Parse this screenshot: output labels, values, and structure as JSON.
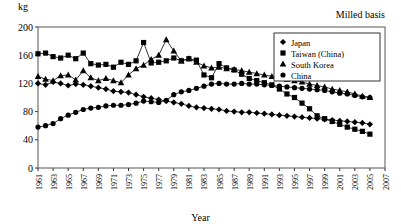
{
  "figure": {
    "unit_label": "kg",
    "note": "Milled basis",
    "xlabel": "Year"
  },
  "legend": {
    "position": "top-right",
    "items": [
      {
        "label": "Japan",
        "marker": "diamond-marker"
      },
      {
        "label": "Taiwan (China)",
        "marker": "square-marker"
      },
      {
        "label": "South Korea",
        "marker": "triangle-marker"
      },
      {
        "label": "China",
        "marker": "circle-marker"
      }
    ]
  },
  "chart_data": {
    "type": "line",
    "title": "",
    "subtitle": "",
    "annotation": "Milled basis",
    "xlabel": "Year",
    "ylabel": "kg",
    "ylim": [
      0,
      200
    ],
    "yticks": [
      0,
      40,
      80,
      120,
      160,
      200
    ],
    "xlim": [
      1961,
      2007
    ],
    "xticks": [
      1961,
      1963,
      1965,
      1967,
      1969,
      1971,
      1973,
      1975,
      1977,
      1979,
      1981,
      1983,
      1985,
      1987,
      1989,
      1991,
      1993,
      1995,
      1997,
      1999,
      2001,
      2003,
      2005,
      2007
    ],
    "grid": false,
    "legend_position": "upper right",
    "x": [
      1961,
      1962,
      1963,
      1964,
      1965,
      1966,
      1967,
      1968,
      1969,
      1970,
      1971,
      1972,
      1973,
      1974,
      1975,
      1976,
      1977,
      1978,
      1979,
      1980,
      1981,
      1982,
      1983,
      1984,
      1985,
      1986,
      1987,
      1988,
      1989,
      1990,
      1991,
      1992,
      1993,
      1994,
      1995,
      1996,
      1997,
      1998,
      1999,
      2000,
      2001,
      2002,
      2003,
      2004,
      2005
    ],
    "series": [
      {
        "name": "Japan",
        "marker": "diamond",
        "values": [
          120,
          118,
          122,
          120,
          117,
          119,
          118,
          116,
          114,
          112,
          109,
          108,
          107,
          104,
          101,
          99,
          97,
          95,
          93,
          91,
          88,
          86,
          85,
          84,
          83,
          81,
          80,
          79,
          79,
          78,
          77,
          76,
          75,
          74,
          73,
          72,
          71,
          70,
          69,
          68,
          67,
          66,
          65,
          64,
          62
        ]
      },
      {
        "name": "Taiwan (China)",
        "marker": "square",
        "values": [
          162,
          163,
          158,
          156,
          160,
          155,
          163,
          148,
          146,
          147,
          143,
          150,
          147,
          152,
          178,
          149,
          150,
          152,
          156,
          152,
          155,
          153,
          132,
          128,
          148,
          142,
          139,
          133,
          127,
          124,
          121,
          118,
          112,
          105,
          100,
          92,
          84,
          74,
          70,
          66,
          62,
          58,
          55,
          52,
          48
        ]
      },
      {
        "name": "South Korea",
        "marker": "triangle",
        "values": [
          130,
          126,
          124,
          131,
          132,
          125,
          138,
          128,
          124,
          127,
          124,
          121,
          132,
          141,
          146,
          154,
          160,
          182,
          166,
          152,
          155,
          150,
          145,
          142,
          143,
          141,
          140,
          138,
          136,
          134,
          132,
          130,
          128,
          126,
          124,
          122,
          119,
          117,
          115,
          112,
          110,
          108,
          105,
          102,
          100
        ]
      },
      {
        "name": "China",
        "marker": "circle",
        "values": [
          58,
          60,
          63,
          70,
          75,
          79,
          83,
          85,
          86,
          88,
          89,
          89,
          90,
          92,
          95,
          94,
          93,
          96,
          104,
          108,
          110,
          113,
          116,
          119,
          120,
          119,
          119,
          120,
          119,
          119,
          118,
          117,
          116,
          115,
          114,
          113,
          112,
          111,
          110,
          108,
          106,
          105,
          103,
          101,
          100
        ]
      }
    ]
  }
}
